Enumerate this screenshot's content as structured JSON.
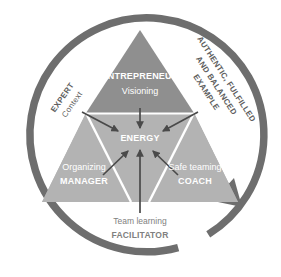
{
  "diagram": {
    "title_visible": false,
    "shape": "triangle-in-circular-arrow",
    "colors": {
      "arc": "#6e6e6e",
      "triangle_top": "#8f8f8f",
      "triangle_bottom_left": "#b4b4b4",
      "triangle_bottom_right": "#b0b0b0",
      "divider": "#ffffff",
      "arrow_dark": "#4a4a4a",
      "label_white": "#ffffff",
      "label_gray": "#808080",
      "label_outer": "#5e5e5e",
      "background": "#ffffff"
    },
    "center": {
      "label": "ENERGY"
    },
    "top_segment": {
      "role": "ENTREPRENEUR",
      "activity": "Visioning"
    },
    "bottom_left_segment": {
      "activity": "Organizing",
      "role": "MANAGER"
    },
    "bottom_right_segment": {
      "activity": "Safe teaming",
      "role": "COACH"
    },
    "bottom_caption": {
      "activity": "Team learning",
      "role": "FACILITATOR"
    },
    "outer_left": {
      "line1": "EXPERT",
      "line2": "Context"
    },
    "outer_right": {
      "line1": "AUTHENTIC, FULFILLED",
      "line2": "AND BALANCED",
      "line3": "EXAMPLE"
    },
    "arc": {
      "name": "clockwise-cycle-arrow",
      "direction": "clockwise"
    }
  }
}
